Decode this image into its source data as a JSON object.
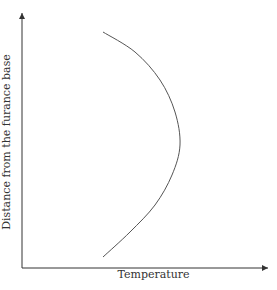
{
  "chart_data": {
    "type": "line",
    "title": "",
    "xlabel": "Temperature",
    "ylabel": "Distance from the furance base",
    "grid": false,
    "ticks": "none",
    "series": [
      {
        "name": "temperature-profile",
        "description": "Curve rising in temperature to a maximum near mid-height, then decreasing toward the top",
        "points_px": [
          [
            103,
            257
          ],
          [
            130,
            232
          ],
          [
            155,
            205
          ],
          [
            172,
            175
          ],
          [
            180,
            145
          ],
          [
            175,
            112
          ],
          [
            160,
            80
          ],
          [
            135,
            52
          ],
          [
            103,
            32
          ]
        ]
      }
    ],
    "colors": {
      "axis": "#333333",
      "curve": "#555555"
    }
  }
}
